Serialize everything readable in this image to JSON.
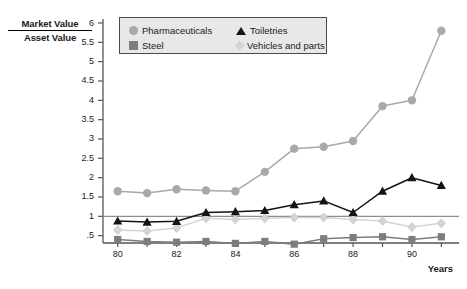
{
  "chart_data": {
    "type": "line",
    "title": "",
    "ylabel_numerator": "Market Value",
    "ylabel_denominator": "Asset Value",
    "xlabel": "Years",
    "x": [
      80,
      81,
      82,
      83,
      84,
      85,
      86,
      87,
      88,
      89,
      90,
      91
    ],
    "xtick_labels": [
      "80",
      "82",
      "84",
      "86",
      "88",
      "90"
    ],
    "xticks": [
      80,
      82,
      84,
      86,
      88,
      90
    ],
    "ytick_labels": [
      "6",
      "5.5",
      "5",
      "4.5",
      "4",
      "3.5",
      "3",
      "2.5",
      "2",
      "1.5",
      "1",
      ".5"
    ],
    "yticks": [
      6,
      5.5,
      5,
      4.5,
      4,
      3.5,
      3,
      2.5,
      2,
      1.5,
      1,
      0.5
    ],
    "ylim": [
      0.31,
      6.0
    ],
    "xlim": [
      79.5,
      91.6
    ],
    "grid": false,
    "reference_line_y": 1.0,
    "legend_position": "top-center",
    "series": [
      {
        "name": "Pharmaceuticals",
        "marker": "circle",
        "color": "#a9a9a9",
        "values": [
          1.65,
          1.6,
          1.7,
          1.67,
          1.65,
          2.15,
          2.75,
          2.8,
          2.95,
          3.85,
          4.0,
          5.8
        ]
      },
      {
        "name": "Toiletries",
        "marker": "triangle",
        "color": "#141414",
        "values": [
          0.88,
          0.85,
          0.87,
          1.1,
          1.12,
          1.15,
          1.3,
          1.4,
          1.1,
          1.65,
          2.0,
          1.8
        ]
      },
      {
        "name": "Steel",
        "marker": "square",
        "color": "#7d7d7d",
        "values": [
          0.4,
          0.35,
          0.33,
          0.35,
          0.3,
          0.35,
          0.28,
          0.42,
          0.45,
          0.47,
          0.4,
          0.47
        ]
      },
      {
        "name": "Vehicles and parts",
        "marker": "diamond",
        "color": "#d4d4d4",
        "values": [
          0.65,
          0.62,
          0.7,
          0.95,
          0.92,
          0.95,
          0.97,
          0.97,
          0.92,
          0.88,
          0.72,
          0.82
        ]
      }
    ]
  },
  "legend": {
    "entries": [
      {
        "label": "Pharmaceuticals",
        "marker": "circle",
        "color": "#a9a9a9"
      },
      {
        "label": "Toiletries",
        "marker": "triangle",
        "color": "#141414"
      },
      {
        "label": "Steel",
        "marker": "square",
        "color": "#7d7d7d"
      },
      {
        "label": "Vehicles and parts",
        "marker": "diamond",
        "color": "#d4d4d4"
      }
    ]
  },
  "axis": {
    "line_color": "#555555",
    "reference_line_color": "#8c8c8c"
  }
}
